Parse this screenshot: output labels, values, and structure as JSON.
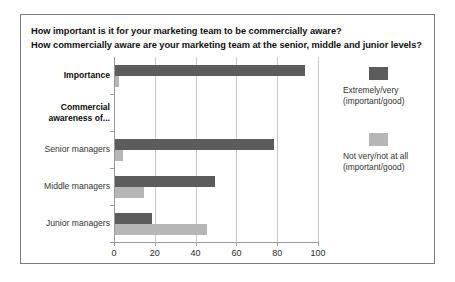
{
  "chart_data": {
    "type": "bar",
    "orientation": "horizontal",
    "title": "How important is it for your marketing team to be commercially aware? How commercially aware are your marketing team at the senior, middle and junior levels?",
    "title_lines": [
      "How important is it for your marketing team to be commercially aware?",
      "How commercially aware are your marketing team at the senior, middle and junior levels?"
    ],
    "categories": [
      "Importance",
      "Commercial awareness of...",
      "Senior managers",
      "Middle managers",
      "Junior managers"
    ],
    "category_labels": [
      {
        "text": "Importance",
        "bold": true,
        "has_bars": true,
        "lines": [
          "Importance"
        ]
      },
      {
        "text": "Commercial awareness of...",
        "bold": true,
        "has_bars": false,
        "lines": [
          "Commercial",
          "awareness of..."
        ]
      },
      {
        "text": "Senior managers",
        "bold": false,
        "has_bars": true,
        "lines": [
          "Senior managers"
        ]
      },
      {
        "text": "Middle managers",
        "bold": false,
        "has_bars": true,
        "lines": [
          "Middle managers"
        ]
      },
      {
        "text": "Junior managers",
        "bold": false,
        "has_bars": true,
        "lines": [
          "Junior managers"
        ]
      }
    ],
    "series": [
      {
        "name": "Extremely/very (important/good)",
        "name_lines": [
          "Extremely/very",
          "(important/good)"
        ],
        "color": "#5c5c5c",
        "values": [
          93,
          null,
          78,
          49,
          18
        ]
      },
      {
        "name": "Not very/not at all (important/good)",
        "name_lines": [
          "Not very/not at all",
          "(important/good)"
        ],
        "color": "#b6b6b6",
        "values": [
          2,
          null,
          4,
          14,
          45
        ]
      }
    ],
    "xlabel": "",
    "ylabel": "",
    "xlim": [
      0,
      100
    ],
    "xticks": [
      0,
      20,
      40,
      60,
      80,
      100
    ],
    "grid": true,
    "legend_position": "right"
  },
  "legend": {
    "items": [
      {
        "label_line1": "Extremely/very",
        "label_line2": "(important/good)",
        "color": "#5c5c5c"
      },
      {
        "label_line1": "Not very/not at all",
        "label_line2": "(important/good)",
        "color": "#b6b6b6"
      }
    ]
  }
}
